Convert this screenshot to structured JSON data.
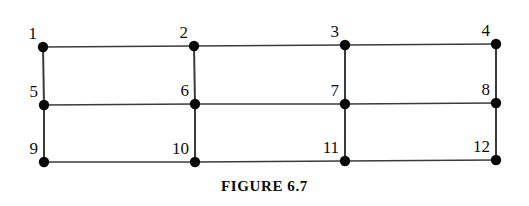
{
  "figure": {
    "caption": "FIGURE 6.7",
    "kind": "graph-diagram",
    "canvas": {
      "width": 529,
      "height": 206
    },
    "style": {
      "background_color": "#ffffff",
      "edge_color": "#3b3b3b",
      "edge_width_horizontal": 1.4,
      "edge_width_vertical": 2.0,
      "node_fill_color": "#0a0a0a",
      "node_radius": 5.2,
      "label_color": "#0d0d0d"
    },
    "nodes": [
      {
        "id": "1",
        "label": "1",
        "x": 43,
        "y": 47,
        "label_x": 37,
        "label_y": 42
      },
      {
        "id": "2",
        "label": "2",
        "x": 194,
        "y": 46,
        "label_x": 188,
        "label_y": 41
      },
      {
        "id": "3",
        "label": "3",
        "x": 345,
        "y": 45,
        "label_x": 339,
        "label_y": 40
      },
      {
        "id": "4",
        "label": "4",
        "x": 496,
        "y": 44,
        "label_x": 490,
        "label_y": 39
      },
      {
        "id": "5",
        "label": "5",
        "x": 44,
        "y": 105,
        "label_x": 38,
        "label_y": 100
      },
      {
        "id": "6",
        "label": "6",
        "x": 195,
        "y": 104,
        "label_x": 189,
        "label_y": 99
      },
      {
        "id": "7",
        "label": "7",
        "x": 345,
        "y": 104,
        "label_x": 339,
        "label_y": 99
      },
      {
        "id": "8",
        "label": "8",
        "x": 496,
        "y": 103,
        "label_x": 490,
        "label_y": 98
      },
      {
        "id": "9",
        "label": "9",
        "x": 44,
        "y": 162,
        "label_x": 38,
        "label_y": 157
      },
      {
        "id": "10",
        "label": "10",
        "x": 195,
        "y": 162,
        "label_x": 189,
        "label_y": 157
      },
      {
        "id": "11",
        "label": "11",
        "x": 345,
        "y": 161,
        "label_x": 339,
        "label_y": 156
      },
      {
        "id": "12",
        "label": "12",
        "x": 496,
        "y": 160,
        "label_x": 490,
        "label_y": 155
      }
    ],
    "edges": [
      {
        "from": "1",
        "to": "2",
        "orientation": "horizontal"
      },
      {
        "from": "2",
        "to": "3",
        "orientation": "horizontal"
      },
      {
        "from": "3",
        "to": "4",
        "orientation": "horizontal"
      },
      {
        "from": "5",
        "to": "6",
        "orientation": "horizontal"
      },
      {
        "from": "6",
        "to": "7",
        "orientation": "horizontal"
      },
      {
        "from": "7",
        "to": "8",
        "orientation": "horizontal"
      },
      {
        "from": "9",
        "to": "10",
        "orientation": "horizontal"
      },
      {
        "from": "10",
        "to": "11",
        "orientation": "horizontal"
      },
      {
        "from": "11",
        "to": "12",
        "orientation": "horizontal"
      },
      {
        "from": "1",
        "to": "5",
        "orientation": "vertical"
      },
      {
        "from": "2",
        "to": "6",
        "orientation": "vertical"
      },
      {
        "from": "3",
        "to": "7",
        "orientation": "vertical"
      },
      {
        "from": "4",
        "to": "8",
        "orientation": "vertical"
      },
      {
        "from": "5",
        "to": "9",
        "orientation": "vertical"
      },
      {
        "from": "6",
        "to": "10",
        "orientation": "vertical"
      },
      {
        "from": "7",
        "to": "11",
        "orientation": "vertical"
      },
      {
        "from": "8",
        "to": "12",
        "orientation": "vertical"
      }
    ]
  }
}
